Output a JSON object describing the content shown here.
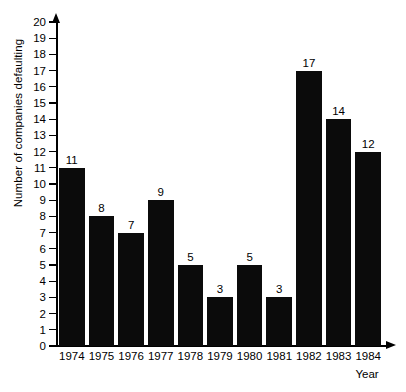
{
  "chart_data": {
    "type": "bar",
    "title": "",
    "xlabel": "Year",
    "ylabel": "Number of companies defaulting",
    "categories": [
      "1974",
      "1975",
      "1976",
      "1977",
      "1978",
      "1979",
      "1980",
      "1981",
      "1982",
      "1983",
      "1984"
    ],
    "values": [
      11,
      8,
      7,
      9,
      5,
      3,
      5,
      3,
      17,
      14,
      12
    ],
    "data_labels": [
      "11",
      "8",
      "7",
      "9",
      "5",
      "3",
      "5",
      "3",
      "17",
      "14",
      "12"
    ],
    "ylim": [
      0,
      20
    ],
    "ytick_labels": [
      "0",
      "1",
      "2",
      "3",
      "4",
      "5",
      "6",
      "7",
      "8",
      "9",
      "10",
      "11",
      "12",
      "13",
      "14",
      "15",
      "16",
      "17",
      "18",
      "19",
      "20"
    ],
    "ytick_values": [
      0,
      1,
      2,
      3,
      4,
      5,
      6,
      7,
      8,
      9,
      10,
      11,
      12,
      13,
      14,
      15,
      16,
      17,
      18,
      19,
      20
    ],
    "grid": false,
    "legend": null,
    "bar_color": "#0b0b0b",
    "axis_color": "#000000",
    "background_color": "#ffffff"
  }
}
